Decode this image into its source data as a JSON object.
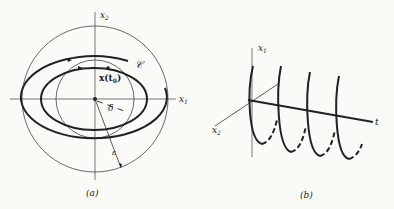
{
  "panel_a": {
    "caption": "(a)",
    "axis_x1": "x",
    "axis_x1_sub": "1",
    "axis_x2": "x",
    "axis_x2_sub": "2",
    "orbit_label": "𝒞",
    "point_label": "x(t",
    "point_label_sub": "0",
    "point_label_close": ")",
    "delta_label": "δ",
    "epsilon_label": "ε"
  },
  "panel_b": {
    "caption": "(b)",
    "axis_x1": "x",
    "axis_x1_sub": "1",
    "axis_x2": "x",
    "axis_x2_sub": "2",
    "axis_t": "t"
  },
  "colors": {
    "ink": "#222222",
    "thin": "#555555",
    "background": "#fafaf7"
  }
}
